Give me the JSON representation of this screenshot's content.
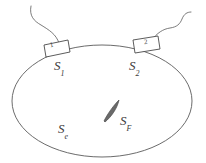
{
  "figure": {
    "background_color": "#ffffff",
    "stroke_color": "#5a5a5a",
    "text_color": "#3a3a3a",
    "domain": {
      "name": "ellipse-body",
      "shape": "ellipse",
      "center": [
        102,
        101
      ],
      "rx": 90,
      "ry": 56
    },
    "labels": {
      "s1": {
        "base": "S",
        "sub": "1"
      },
      "s2": {
        "base": "S",
        "sub": "2"
      },
      "sf": {
        "base": "S",
        "sub": "F"
      },
      "se": {
        "base": "S",
        "sub": "e"
      }
    },
    "transducers": [
      {
        "name": "transducer-1",
        "number": "1",
        "x": 58,
        "y": 45,
        "width": 24,
        "height": 13,
        "rotation": -11
      },
      {
        "name": "transducer-2",
        "number": "2",
        "x": 150,
        "y": 42,
        "width": 24,
        "height": 13,
        "rotation": -7
      }
    ],
    "leads": [
      {
        "name": "lead-wire-1",
        "from": "transducer-1",
        "direction": "up-left"
      },
      {
        "name": "lead-wire-2",
        "from": "transducer-2",
        "direction": "up-right"
      }
    ],
    "flaw": {
      "name": "flaw-sliver",
      "shape": "thin-lens",
      "center": [
        112,
        110
      ],
      "length": 22,
      "thickness": 4,
      "rotation": -55
    }
  }
}
